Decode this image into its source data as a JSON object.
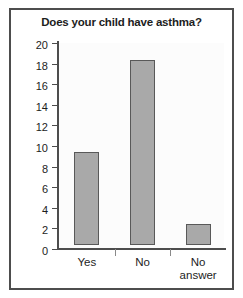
{
  "chart_data": {
    "type": "bar",
    "title": "Does your child have asthma?",
    "xlabel": "",
    "ylabel": "",
    "categories": [
      "Yes",
      "No",
      "No answer"
    ],
    "values": [
      9,
      18,
      2
    ],
    "ylim": [
      0,
      20
    ],
    "ytick_step": 2,
    "yticks": [
      "0",
      "2",
      "4",
      "6",
      "8",
      "10",
      "12",
      "14",
      "16",
      "18",
      "20"
    ],
    "grid": false,
    "legend": null,
    "bar_color": "#a9a9a9",
    "bar_edge_color": "#595959",
    "frame_color": "#4d4d4d",
    "axis_color": "#4d4d4d",
    "plot_background": "#fcfcfc",
    "category_labels_wrapped": [
      [
        "Yes"
      ],
      [
        "No"
      ],
      [
        "No",
        "answer"
      ]
    ]
  }
}
